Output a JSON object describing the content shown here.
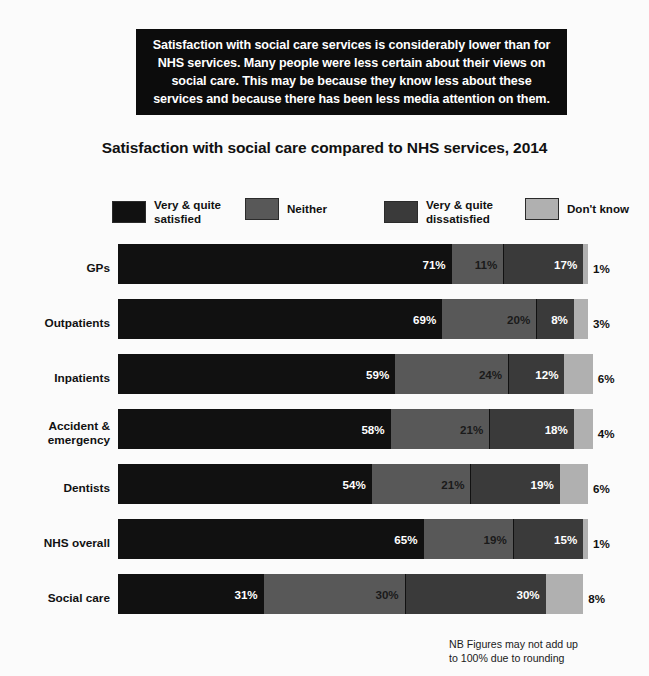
{
  "callout": {
    "text": "Satisfaction with social care services is considerably lower than for NHS services. Many people were less certain about their views on social care. This may be because they know less about these services and because there has been less media attention on them."
  },
  "title": "Satisfaction with social care compared to NHS services, 2014",
  "footnote": "NB Figures may not add up\nto 100% due to rounding",
  "colors": {
    "satisfied": "#111111",
    "neither": "#585858",
    "dissatisfied": "#3a3a3a",
    "dont_know": "#b0b0b0",
    "callout_bg": "#0c0c0c",
    "page_bg": "#fbfbfb"
  },
  "chart_data": {
    "type": "bar",
    "title": "Satisfaction with social care compared to NHS services, 2014",
    "xlabel": "",
    "ylabel": "",
    "xlim": [
      0,
      100
    ],
    "grid": false,
    "stacked": true,
    "orientation": "horizontal",
    "legend_position": "top",
    "categories": [
      "GPs",
      "Outpatients",
      "Inpatients",
      "Accident &\nemergency",
      "Dentists",
      "NHS overall",
      "Social care"
    ],
    "series": [
      {
        "name": "Very & quite\nsatisfied",
        "values": [
          71,
          69,
          59,
          58,
          54,
          65,
          31
        ]
      },
      {
        "name": "Neither",
        "values": [
          11,
          20,
          24,
          21,
          21,
          19,
          30
        ]
      },
      {
        "name": "Very & quite\ndissatisfied",
        "values": [
          17,
          8,
          12,
          18,
          19,
          15,
          30
        ]
      },
      {
        "name": "Don't know",
        "values": [
          1,
          3,
          6,
          4,
          6,
          1,
          8
        ]
      }
    ],
    "value_labels": [
      [
        "71%",
        "11%",
        "17%",
        "1%"
      ],
      [
        "69%",
        "20%",
        "8%",
        "3%"
      ],
      [
        "59%",
        "24%",
        "12%",
        "6%"
      ],
      [
        "58%",
        "21%",
        "18%",
        "4%"
      ],
      [
        "54%",
        "21%",
        "19%",
        "6%"
      ],
      [
        "65%",
        "19%",
        "15%",
        "1%"
      ],
      [
        "31%",
        "30%",
        "30%",
        "8%"
      ]
    ],
    "annotations": [
      "NB Figures may not add up to 100% due to rounding"
    ]
  }
}
